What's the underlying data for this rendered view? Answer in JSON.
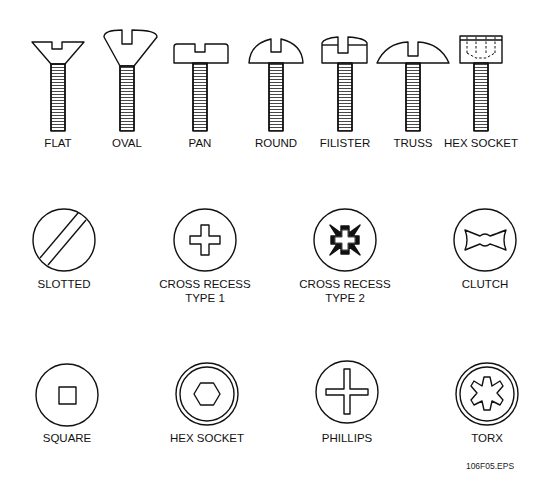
{
  "screw_heads": [
    {
      "label": "FLAT",
      "cx": 58
    },
    {
      "label": "OVAL",
      "cx": 127
    },
    {
      "label": "PAN",
      "cx": 200
    },
    {
      "label": "ROUND",
      "cx": 276
    },
    {
      "label": "FILISTER",
      "cx": 345
    },
    {
      "label": "TRUSS",
      "cx": 413
    },
    {
      "label": "HEX SOCKET",
      "cx": 481
    }
  ],
  "drive_types_row1": [
    {
      "label": "SLOTTED",
      "line2": "",
      "cx": 64
    },
    {
      "label": "CROSS RECESS",
      "line2": "TYPE 1",
      "cx": 205
    },
    {
      "label": "CROSS RECESS",
      "line2": "TYPE 2",
      "cx": 345
    },
    {
      "label": "CLUTCH",
      "line2": "",
      "cx": 485
    }
  ],
  "drive_types_row2": [
    {
      "label": "SQUARE",
      "cx": 67
    },
    {
      "label": "HEX SOCKET",
      "cx": 207
    },
    {
      "label": "PHILLIPS",
      "cx": 347
    },
    {
      "label": "TORX",
      "cx": 487
    }
  ],
  "caption": "106F05.EPS",
  "colors": {
    "stroke": "#111111",
    "background": "#ffffff"
  }
}
